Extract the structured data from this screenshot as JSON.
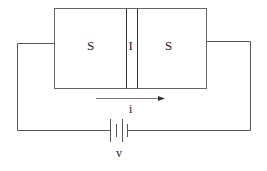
{
  "diagram": {
    "junction": {
      "left_label": "S",
      "middle_label": "I",
      "right_label": "S"
    },
    "current": {
      "label": "i",
      "direction": "left-to-right"
    },
    "source": {
      "label": "v",
      "type": "battery"
    },
    "colors": {
      "stroke": "#555555",
      "text": "#222222",
      "background": "#ffffff"
    }
  }
}
